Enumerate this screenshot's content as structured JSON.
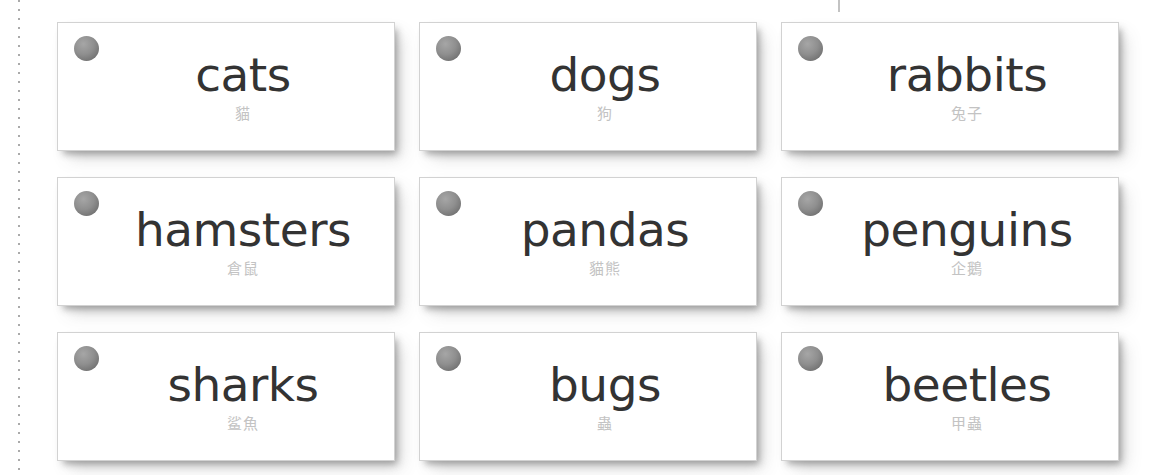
{
  "page": {
    "background_color": "#ffffff",
    "card_background_color": "#ffffff",
    "card_border_color": "#d2d2d2",
    "english_text_color": "#333333",
    "chinese_text_color": "#c3c3c3",
    "hole_punch_color": "#8f8f8f",
    "cut_guide_color": "#8d8d8d"
  },
  "guides": {
    "left_cut_line": "vertical-dotted-cut-guide",
    "top_crop_mark": "crop-tick-mark"
  },
  "grid": {
    "rows": 3,
    "columns": 3,
    "total_cards": 9
  },
  "cards": [
    {
      "english": "cats",
      "chinese": "貓",
      "hole": "hole-punch"
    },
    {
      "english": "dogs",
      "chinese": "狗",
      "hole": "hole-punch"
    },
    {
      "english": "rabbits",
      "chinese": "兔子",
      "hole": "hole-punch"
    },
    {
      "english": "hamsters",
      "chinese": "倉鼠",
      "hole": "hole-punch"
    },
    {
      "english": "pandas",
      "chinese": "貓熊",
      "hole": "hole-punch"
    },
    {
      "english": "penguins",
      "chinese": "企鵝",
      "hole": "hole-punch"
    },
    {
      "english": "sharks",
      "chinese": "鲨魚",
      "hole": "hole-punch"
    },
    {
      "english": "bugs",
      "chinese": "蟲",
      "hole": "hole-punch"
    },
    {
      "english": "beetles",
      "chinese": "甲蟲",
      "hole": "hole-punch"
    }
  ]
}
